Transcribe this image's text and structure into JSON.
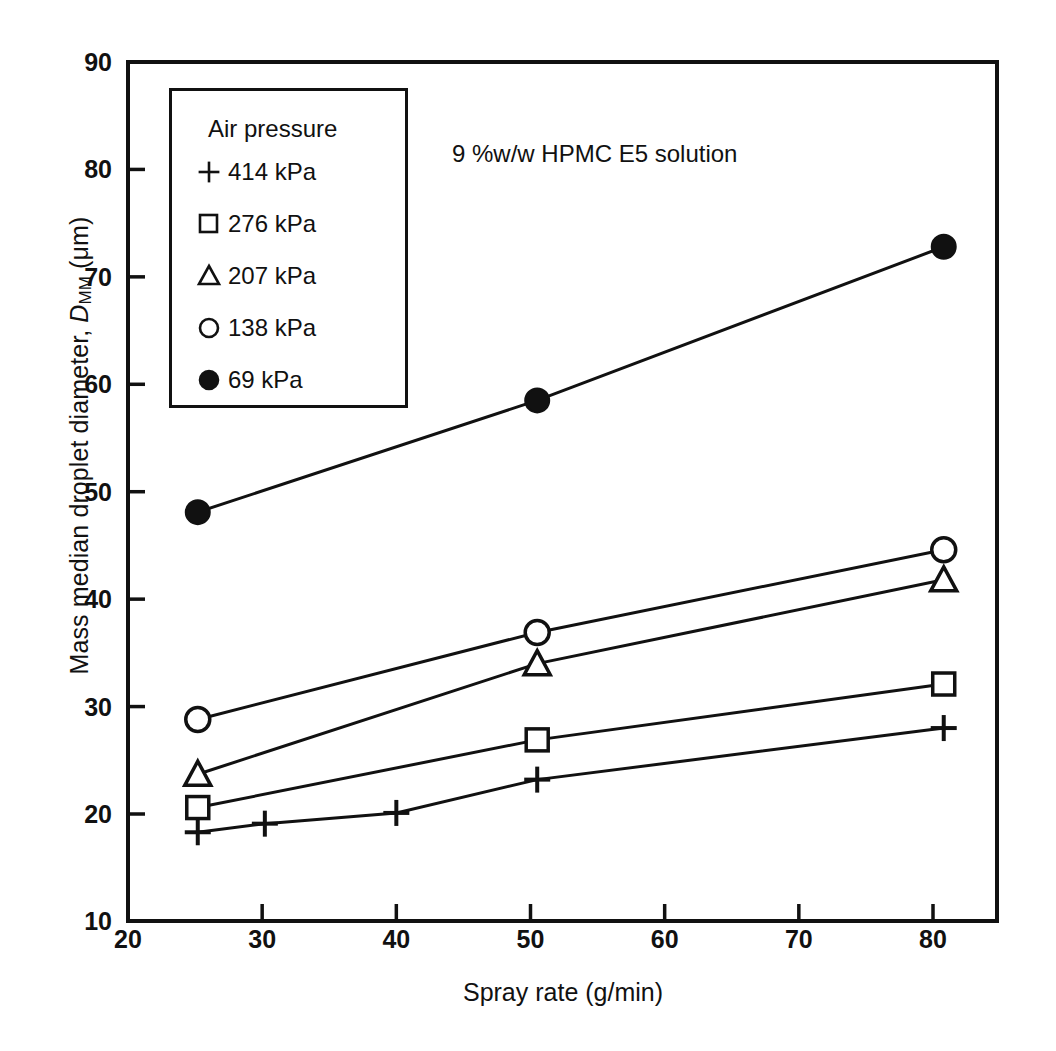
{
  "chart_data": {
    "type": "line",
    "title": "9 %w/w HPMC E5 solution",
    "xlabel": "Spray rate (g/min)",
    "ylabel": "Mass median droplet diameter, D_MM (μm)",
    "ylabel_main": "Mass median droplet diameter, ",
    "ylabel_symbol": "D",
    "ylabel_subscript": "MM",
    "ylabel_units": " (μm)",
    "xlim": [
      20,
      85
    ],
    "ylim": [
      10,
      90
    ],
    "xticks": [
      20,
      30,
      40,
      50,
      60,
      70,
      80
    ],
    "yticks": [
      10,
      20,
      30,
      40,
      50,
      60,
      70,
      80,
      90
    ],
    "xtick_labels": [
      "20",
      "30",
      "40",
      "50",
      "60",
      "70",
      "80"
    ],
    "ytick_labels": [
      "10",
      "20",
      "30",
      "40",
      "50",
      "60",
      "70",
      "80",
      "90"
    ],
    "grid": false,
    "legend_position": "upper-left-inside",
    "legend_title": "Air pressure",
    "series": [
      {
        "name": "414 kPa",
        "marker": "plus",
        "filled": false,
        "x": [
          25.2,
          30.2,
          40.0,
          50.5,
          80.8
        ],
        "values": [
          18.3,
          19.1,
          20.1,
          23.2,
          28.0
        ]
      },
      {
        "name": "276 kPa",
        "marker": "square",
        "filled": false,
        "x": [
          25.2,
          50.5,
          80.8
        ],
        "values": [
          20.6,
          26.9,
          32.1
        ]
      },
      {
        "name": "207 kPa",
        "marker": "triangle",
        "filled": false,
        "x": [
          25.2,
          50.5,
          80.8
        ],
        "values": [
          23.7,
          34.0,
          41.8
        ]
      },
      {
        "name": "138 kPa",
        "marker": "circle",
        "filled": false,
        "x": [
          25.2,
          50.5,
          80.8
        ],
        "values": [
          28.8,
          36.9,
          44.6
        ]
      },
      {
        "name": "69 kPa",
        "marker": "circle",
        "filled": true,
        "x": [
          25.2,
          50.5,
          80.8
        ],
        "values": [
          48.1,
          58.5,
          72.8
        ]
      }
    ]
  },
  "colors": {
    "line": "#111111",
    "axis": "#111111",
    "background": "#ffffff"
  }
}
